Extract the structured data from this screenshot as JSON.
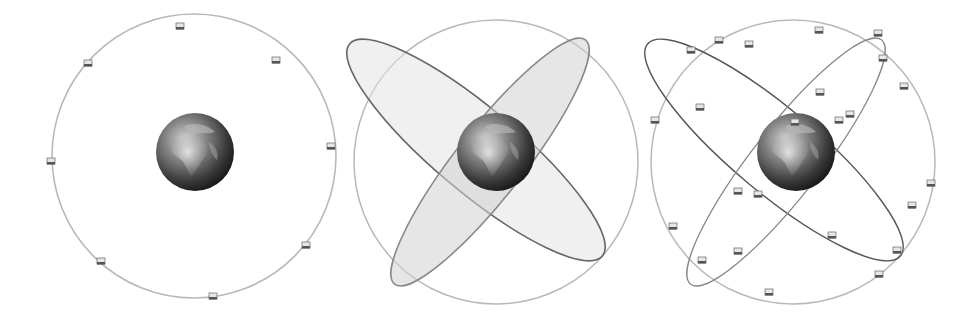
{
  "figure": {
    "colors": {
      "background": "#ffffff",
      "orbit_light": "#b8b8b8",
      "orbit_dark": "#555555",
      "plane_fill": "#d6d6d6",
      "earth_dark": "#1e1e1e",
      "earth_light": "#b0b0b0"
    },
    "panels": [
      {
        "name": "single-orbit",
        "satellites": 8,
        "orbits": 1
      },
      {
        "name": "orbital-planes",
        "satellites": 0,
        "orbits": 3
      },
      {
        "name": "full-constellation",
        "satellites": 24,
        "orbits": 3
      }
    ]
  }
}
